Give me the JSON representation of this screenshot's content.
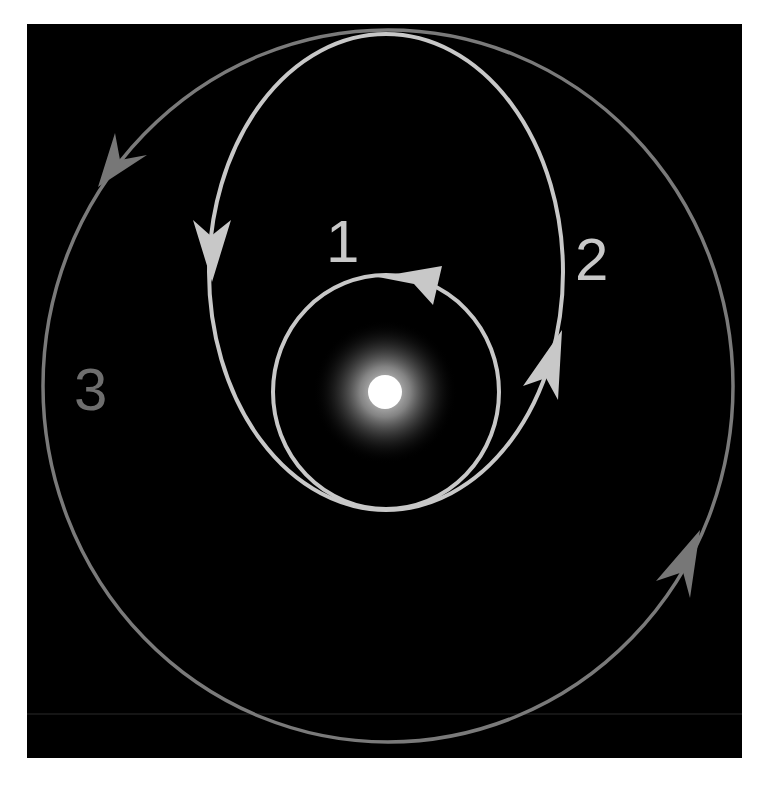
{
  "diagram": {
    "background_color": "#000000",
    "page_color": "#ffffff",
    "panel": {
      "x": 27,
      "y": 24,
      "width": 715,
      "height": 734
    },
    "star": {
      "cx": 385,
      "cy": 392,
      "core_radius": 17,
      "glow_radius": 72,
      "core_color": "#ffffff",
      "glow_color": "#bdbdbd"
    },
    "orbits": [
      {
        "id": "1",
        "label": "1",
        "kind": "initial circular orbit",
        "shape": "ellipse",
        "cx": 386,
        "cy": 392,
        "rx": 113,
        "ry": 117,
        "color": "#c8c8c8",
        "stroke_width": 4,
        "direction": "counterclockwise"
      },
      {
        "id": "2",
        "label": "2",
        "kind": "transfer elliptical orbit",
        "shape": "ellipse",
        "cx": 386,
        "cy": 272,
        "rx": 177,
        "ry": 238,
        "color": "#c8c8c8",
        "stroke_width": 4,
        "direction": "counterclockwise"
      },
      {
        "id": "3",
        "label": "3",
        "kind": "final circular orbit",
        "shape": "ellipse",
        "cx": 388,
        "cy": 386,
        "rx": 345,
        "ry": 356,
        "color": "#7a7a7a",
        "stroke_width": 3.5,
        "direction": "counterclockwise"
      }
    ],
    "labels": [
      {
        "text": "1",
        "x": 326,
        "y": 262,
        "size": 60,
        "color": "#c8c8c8"
      },
      {
        "text": "2",
        "x": 575,
        "y": 280,
        "size": 60,
        "color": "#c8c8c8"
      },
      {
        "text": "3",
        "x": 74,
        "y": 410,
        "size": 60,
        "color": "#6e6e6e"
      }
    ],
    "arrows": [
      {
        "orbit": "1",
        "direction": "left",
        "color": "#c8c8c8",
        "points": "442,266 433,305 414,284 378,277"
      },
      {
        "orbit": "2",
        "direction": "down",
        "color": "#c8c8c8",
        "points": "212,282 193,220 211,236 231,220"
      },
      {
        "orbit": "2",
        "direction": "up",
        "color": "#c8c8c8",
        "points": "562,330 558,400 546,378 523,386"
      },
      {
        "orbit": "3",
        "direction": "down-left",
        "color": "#777777",
        "points": "98,187 115,133 120,160 147,155"
      },
      {
        "orbit": "3",
        "direction": "up-right",
        "color": "#777777",
        "points": "700,530 690,598 683,572 656,581"
      }
    ],
    "scan_line": {
      "y": 714,
      "color": "#2a2a2a"
    }
  }
}
